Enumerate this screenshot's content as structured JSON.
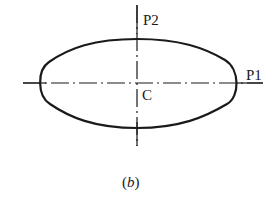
{
  "figure": {
    "caption_open": "(",
    "caption_letter": "b",
    "caption_close": ")",
    "labels": {
      "p1": "P1",
      "p2": "P2",
      "center": "C"
    },
    "colors": {
      "stroke": "#1a1a1a",
      "background": "#ffffff"
    }
  }
}
